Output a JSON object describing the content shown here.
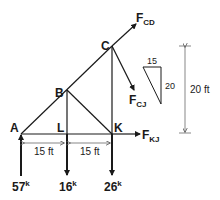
{
  "nodes": {
    "A": "A",
    "B": "B",
    "C": "C",
    "K": "K",
    "L": "L"
  },
  "forces": {
    "fcd": {
      "main": "F",
      "sub": "CD"
    },
    "fcj": {
      "main": "F",
      "sub": "CJ"
    },
    "fkj": {
      "main": "F",
      "sub": "KJ"
    }
  },
  "loads": [
    {
      "value": "57",
      "unit": "k",
      "direction": "up"
    },
    {
      "value": "16",
      "unit": "k",
      "direction": "down"
    },
    {
      "value": "26",
      "unit": "k",
      "direction": "down"
    }
  ],
  "dimensions": {
    "span1": "15 ft",
    "span2": "15 ft",
    "height": "20 ft",
    "slope_horizontal": "15",
    "slope_vertical": "20"
  },
  "colors": {
    "line": "#1a1a1a",
    "dim_line": "#555555"
  }
}
